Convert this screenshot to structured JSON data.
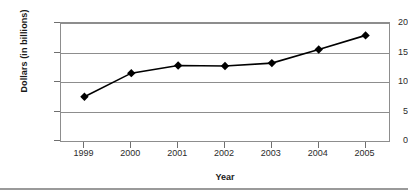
{
  "chart_data": {
    "type": "line",
    "title": "",
    "xlabel": "Year",
    "ylabel": "Dollars (in billions)",
    "categories": [
      "1999",
      "2000",
      "2001",
      "2002",
      "2003",
      "2004",
      "2005"
    ],
    "values": [
      7.5,
      11.5,
      12.8,
      12.7,
      13.2,
      15.5,
      17.9
    ],
    "series": [
      {
        "name": "Dollars (in billions)",
        "values": [
          7.5,
          11.5,
          12.8,
          12.7,
          13.2,
          15.5,
          17.9
        ]
      }
    ],
    "ylim": [
      0,
      20
    ],
    "ytick_labels": [
      "0",
      "5",
      "10",
      "15",
      "20"
    ],
    "ytick_values": [
      0,
      5,
      10,
      15,
      20
    ],
    "grid": "horizontal",
    "legend": "none",
    "marker": "diamond",
    "line_color": "#000000",
    "marker_color": "#000000",
    "grid_color": "#8d8d8d",
    "background_color": "#ffffff"
  }
}
